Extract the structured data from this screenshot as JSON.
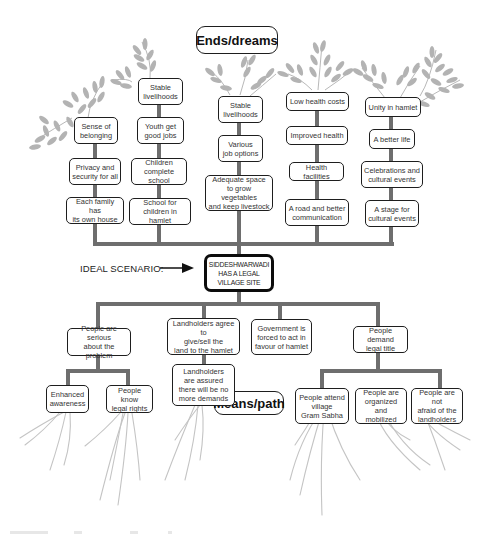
{
  "diagram": {
    "type": "problem-solution tree",
    "ends_title": "Ends/dreams",
    "means_title": "Means/path",
    "ideal_scenario_label": "IDEAL SCENARIO:",
    "central_goal": "SIDDESHWARWADI\nHAS A LEGAL\nVILLAGE SITE",
    "ends_branches": [
      {
        "id": "belonging",
        "nodes_top_to_bottom": [
          "Sense of\nbelonging",
          "Privacy and\nsecurity for all",
          "Each family has\nits own house"
        ]
      },
      {
        "id": "education",
        "nodes_top_to_bottom": [
          "Stable\nlivelihoods",
          "Youth get\ngood jobs",
          "Children\ncomplete school",
          "School for\nchildren in hamlet"
        ]
      },
      {
        "id": "livelihood",
        "nodes_top_to_bottom": [
          "Stable\nlivelihoods",
          "Various\njob options",
          "Adequate space\nto grow vegetables\nand keep livestock"
        ]
      },
      {
        "id": "health",
        "nodes_top_to_bottom": [
          "Low health costs",
          "Improved health",
          "Health facilities",
          "A road and better\ncommunication"
        ]
      },
      {
        "id": "unity",
        "nodes_top_to_bottom": [
          "Unity in hamlet",
          "A better life",
          "Celebrations and\ncultural events",
          "A stage for\ncultural events"
        ]
      }
    ],
    "means_branches": [
      {
        "id": "serious",
        "node": "People are serious\nabout the problem",
        "children": [
          "Enhanced\nawareness",
          "People know\nlegal rights"
        ]
      },
      {
        "id": "landholders",
        "node": "Landholders agree to\ngive/sell the\nland to the hamlet",
        "children": [
          "Landholders\nare assured\nthere will be no\nmore demands"
        ]
      },
      {
        "id": "government",
        "node": "Government is\nforced to act in\nfavour of hamlet",
        "children": []
      },
      {
        "id": "demand",
        "node": "People demand\nlegal title",
        "children": [
          "People attend\nvillage\nGram Sabha",
          "People are\norganized and\nmobilized",
          "People are not\nafraid of the\nlandholders"
        ]
      }
    ],
    "colors": {
      "connector": "#6e6e6e",
      "node_border": "#1e1e1e",
      "leaf": "#b3b3b3",
      "root": "#c4c4c4",
      "central_border": "#0c0c0c"
    }
  }
}
